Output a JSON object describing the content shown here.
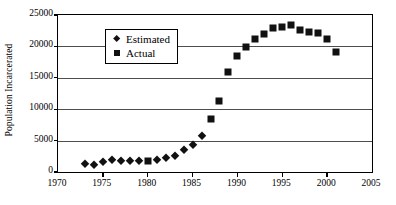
{
  "chart_data": {
    "type": "scatter",
    "title": "",
    "xlabel": "",
    "ylabel": "Population Incarcerated",
    "xlim": [
      1970,
      2005
    ],
    "ylim": [
      0,
      25000
    ],
    "xticks": [
      1970,
      1975,
      1980,
      1985,
      1990,
      1995,
      2000,
      2005
    ],
    "xtick_labels": [
      "1970",
      "1975",
      "1980",
      "1985",
      "1990",
      "1995",
      "2000",
      "2005"
    ],
    "yticks": [
      0,
      5000,
      10000,
      15000,
      20000,
      25000
    ],
    "ytick_labels": [
      "0",
      "5000",
      "10000",
      "15000",
      "20000",
      "25000"
    ],
    "grid": "horizontal",
    "legend_position": "upper-left-inside",
    "series": [
      {
        "name": "Estimated",
        "marker": "diamond",
        "color": "#111111",
        "points": [
          {
            "x": 1973,
            "y": 1250
          },
          {
            "x": 1974,
            "y": 1150
          },
          {
            "x": 1975,
            "y": 1550
          },
          {
            "x": 1976,
            "y": 1900
          },
          {
            "x": 1977,
            "y": 1750
          },
          {
            "x": 1978,
            "y": 1700
          },
          {
            "x": 1979,
            "y": 1700
          },
          {
            "x": 1981,
            "y": 1900
          },
          {
            "x": 1982,
            "y": 2300
          },
          {
            "x": 1983,
            "y": 2600
          },
          {
            "x": 1984,
            "y": 3500
          },
          {
            "x": 1985,
            "y": 4250
          },
          {
            "x": 1986,
            "y": 5800
          }
        ]
      },
      {
        "name": "Actual",
        "marker": "square",
        "color": "#111111",
        "points": [
          {
            "x": 1980,
            "y": 1800
          },
          {
            "x": 1987,
            "y": 8400
          },
          {
            "x": 1988,
            "y": 11300
          },
          {
            "x": 1989,
            "y": 15850
          },
          {
            "x": 1990,
            "y": 18400
          },
          {
            "x": 1991,
            "y": 19850
          },
          {
            "x": 1992,
            "y": 21250
          },
          {
            "x": 1993,
            "y": 22050
          },
          {
            "x": 1994,
            "y": 22950
          },
          {
            "x": 1995,
            "y": 23150
          },
          {
            "x": 1996,
            "y": 23400
          },
          {
            "x": 1997,
            "y": 22550
          },
          {
            "x": 1998,
            "y": 22300
          },
          {
            "x": 1999,
            "y": 22150
          },
          {
            "x": 2000,
            "y": 21100
          },
          {
            "x": 2001,
            "y": 19150
          }
        ]
      }
    ],
    "legend": [
      {
        "label": "Estimated",
        "marker": "diamond"
      },
      {
        "label": "Actual",
        "marker": "square"
      }
    ]
  }
}
